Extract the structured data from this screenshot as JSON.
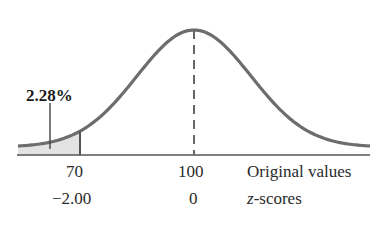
{
  "chart_data": {
    "type": "area",
    "title": "",
    "distribution": {
      "mean": 100,
      "sd": 15
    },
    "shaded_region": {
      "from": "-inf",
      "to": 70,
      "percent_label": "2.28%"
    },
    "x_axis_rows": [
      {
        "name": "Original values",
        "ticks": [
          "70",
          "100"
        ]
      },
      {
        "name": "z-scores",
        "ticks": [
          "−2.00",
          "0"
        ]
      }
    ],
    "mean_line": {
      "x": 100,
      "style": "dashed"
    },
    "colors": {
      "curve": "#6d6d6d",
      "shade": "#e3e3e3",
      "axis": "#555555"
    }
  },
  "labels": {
    "percent": "2.28%",
    "tick_70": "70",
    "tick_100": "100",
    "row1_name": "Original values",
    "tick_z_neg2": "−2.00",
    "tick_z_0": "0",
    "row2_name_italic": "z",
    "row2_name_rest": "-scores"
  }
}
